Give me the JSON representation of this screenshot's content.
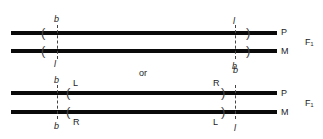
{
  "diagram": {
    "connector": "or",
    "top_config": {
      "generation": "F₁",
      "chromosomes": [
        {
          "label": "P"
        },
        {
          "label": "M"
        }
      ],
      "left_locus": {
        "above": "b",
        "below": "l"
      },
      "right_locus": {
        "above": "l",
        "below": "b"
      }
    },
    "bottom_config": {
      "generation": "F₁",
      "chromosomes": [
        {
          "label": "P"
        },
        {
          "label": "M"
        }
      ],
      "left_locus": {
        "above": "b",
        "below": "b"
      },
      "left_breakpoint": {
        "above": "L",
        "below": "R"
      },
      "right_breakpoint": {
        "above": "R",
        "below": "L"
      },
      "right_locus": {
        "above": "b",
        "below": "l"
      }
    }
  }
}
